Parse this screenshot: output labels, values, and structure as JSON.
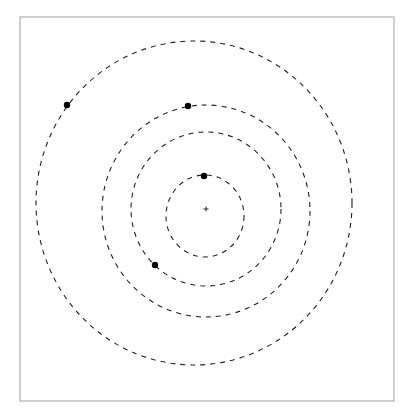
{
  "diagram": {
    "type": "concentric-dashed-orbits",
    "frame": {
      "x": 20,
      "y": 17,
      "width": 374,
      "height": 384,
      "stroke": "#b0b0b0"
    },
    "center_marker": {
      "x": 206,
      "y": 209,
      "symbol": "+"
    },
    "rings": [
      {
        "name": "ring-1-innermost",
        "cx": 205,
        "cy": 216,
        "rx": 39,
        "ry": 41
      },
      {
        "name": "ring-2",
        "cx": 206,
        "cy": 209,
        "rx": 75,
        "ry": 77
      },
      {
        "name": "ring-3",
        "cx": 206,
        "cy": 211,
        "rx": 104,
        "ry": 106
      },
      {
        "name": "ring-4-outermost",
        "cx": 194,
        "cy": 203,
        "rx": 158,
        "ry": 162
      }
    ],
    "bodies": [
      {
        "name": "body-ring-1",
        "x": 204,
        "y": 176,
        "r": 3.2
      },
      {
        "name": "body-ring-2",
        "x": 155,
        "y": 265,
        "r": 3.2
      },
      {
        "name": "body-ring-3",
        "x": 188,
        "y": 106,
        "r": 3.2
      },
      {
        "name": "body-ring-4",
        "x": 67,
        "y": 105,
        "r": 3.2
      }
    ],
    "colors": {
      "line": "#222222",
      "dot": "#000000",
      "frame": "#b0b0b0",
      "background": "#ffffff"
    }
  }
}
